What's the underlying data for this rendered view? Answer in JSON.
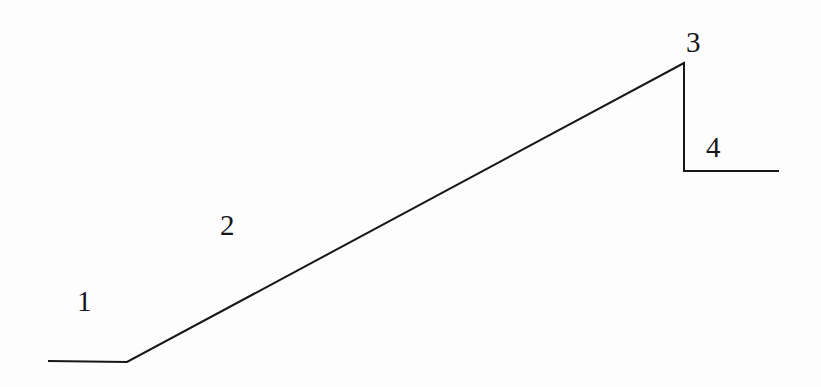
{
  "figure": {
    "background_color": "#fdfdfd",
    "stroke_color": "#17171a",
    "stroke_width": 2,
    "width": 821,
    "height": 387,
    "labels": [
      {
        "id": "label-1",
        "text": "1",
        "x": 84,
        "y": 302,
        "describes": "lower horizontal plateau segment"
      },
      {
        "id": "label-2",
        "text": "2",
        "x": 231,
        "y": 226,
        "describes": "rising diagonal ramp segment"
      },
      {
        "id": "label-3",
        "text": "3",
        "x": 694,
        "y": 43,
        "describes": "vertical drop segment at apex"
      },
      {
        "id": "label-4",
        "text": "4",
        "x": 717,
        "y": 148,
        "describes": "upper-right horizontal plateau segment"
      }
    ],
    "polyline": {
      "label": "profile-polyline",
      "points": [
        {
          "x": 48,
          "y": 361
        },
        {
          "x": 127,
          "y": 362
        },
        {
          "x": 684,
          "y": 63
        },
        {
          "x": 684,
          "y": 171
        },
        {
          "x": 779,
          "y": 171
        }
      ],
      "points_attr": "48,361 127,362 684,63 684,171 779,171"
    }
  },
  "chart_data": {
    "type": "line",
    "title": "",
    "xlabel": "",
    "ylabel": "",
    "xlim": [
      0,
      821
    ],
    "ylim": [
      387,
      0
    ],
    "grid": false,
    "legend": "none",
    "series": [
      {
        "name": "profile",
        "x": [
          48,
          127,
          684,
          684,
          779
        ],
        "y": [
          361,
          362,
          63,
          171,
          171
        ]
      }
    ],
    "annotations": [
      {
        "text": "1",
        "x": 84,
        "y": 302
      },
      {
        "text": "2",
        "x": 231,
        "y": 226
      },
      {
        "text": "3",
        "x": 694,
        "y": 43
      },
      {
        "text": "4",
        "x": 717,
        "y": 148
      }
    ]
  }
}
